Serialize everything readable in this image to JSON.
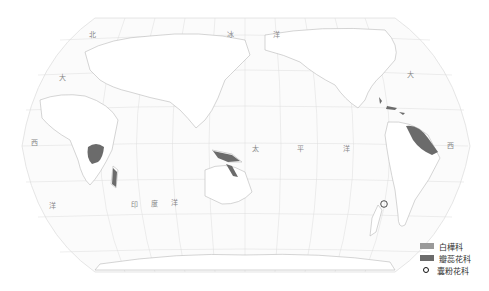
{
  "map": {
    "projection": "pacific-centered world map",
    "colors": {
      "graticule": "#dddddd",
      "coastline": "#bdbdbd",
      "land": "#ffffff",
      "ocean": "#fbfbfb",
      "baileyaceae_fill": "#9a9a9a",
      "petrosaviaceae_fill": "#6b6b6b",
      "circle_marker": "#222222"
    },
    "ocean_labels": [
      {
        "id": "arctic-1",
        "text": "北",
        "x": 89,
        "y": 29
      },
      {
        "id": "arctic-2",
        "text": "冰",
        "x": 227,
        "y": 29
      },
      {
        "id": "arctic-3",
        "text": "洋",
        "x": 273,
        "y": 29
      },
      {
        "id": "atlantic-w-1",
        "text": "大",
        "x": 59,
        "y": 72
      },
      {
        "id": "atlantic-w-2",
        "text": "西",
        "x": 31,
        "y": 137
      },
      {
        "id": "atlantic-w-3",
        "text": "洋",
        "x": 49,
        "y": 200
      },
      {
        "id": "indian-1",
        "text": "印",
        "x": 131,
        "y": 199
      },
      {
        "id": "indian-2",
        "text": "度",
        "x": 151,
        "y": 198
      },
      {
        "id": "indian-3",
        "text": "洋",
        "x": 171,
        "y": 197
      },
      {
        "id": "pacific-1",
        "text": "太",
        "x": 252,
        "y": 143
      },
      {
        "id": "pacific-2",
        "text": "平",
        "x": 297,
        "y": 143
      },
      {
        "id": "pacific-3",
        "text": "洋",
        "x": 343,
        "y": 143
      },
      {
        "id": "atlantic-e-1",
        "text": "大",
        "x": 407,
        "y": 69
      },
      {
        "id": "atlantic-e-2",
        "text": "西",
        "x": 447,
        "y": 140
      }
    ]
  },
  "legend": {
    "items": [
      {
        "label": "白樺科",
        "type": "swatch",
        "color": "#9a9a9a"
      },
      {
        "label": "瓣蕊花科",
        "type": "swatch",
        "color": "#6b6b6b"
      },
      {
        "label": "囊粉花科",
        "type": "circle",
        "color": "#111111"
      }
    ]
  }
}
